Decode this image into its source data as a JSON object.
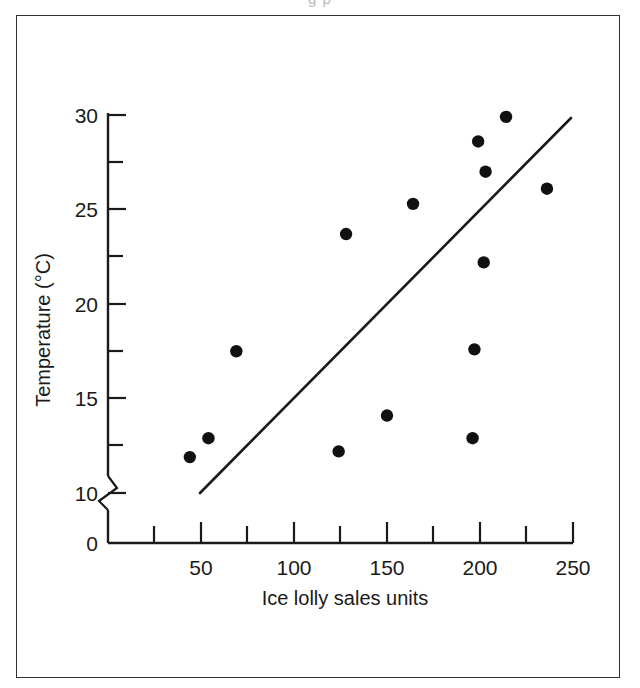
{
  "figure": {
    "scan_artifact_text": "g p"
  },
  "chart_data": {
    "type": "scatter",
    "title": "",
    "xlabel": "Ice lolly sales units",
    "ylabel": "Temperature (°C)",
    "xlim": [
      0,
      250
    ],
    "ylim": [
      10,
      30
    ],
    "y_axis_break": true,
    "y_axis_break_between": [
      0,
      10
    ],
    "grid": false,
    "legend": null,
    "x_ticks_major": [
      50,
      100,
      150,
      200,
      250
    ],
    "x_tick_labels": [
      "50",
      "100",
      "150",
      "200",
      "250"
    ],
    "x_ticks_minor": [
      25,
      75,
      125,
      175,
      225
    ],
    "y_ticks_major": [
      0,
      10,
      15,
      20,
      25,
      30
    ],
    "y_tick_labels": [
      "0",
      "10",
      "15",
      "20",
      "25",
      "30"
    ],
    "y_ticks_minor": [
      12.5,
      17.5,
      22.5,
      27.5
    ],
    "x": [
      44,
      54,
      69,
      124,
      128,
      150,
      164,
      196,
      197,
      199,
      202,
      203,
      214,
      236
    ],
    "y": [
      11.9,
      12.9,
      17.5,
      12.2,
      23.7,
      14.1,
      25.3,
      12.9,
      17.6,
      28.6,
      22.2,
      27.0,
      29.9,
      26.1
    ],
    "points": [
      {
        "x": 44,
        "y": 11.9
      },
      {
        "x": 54,
        "y": 12.9
      },
      {
        "x": 69,
        "y": 17.5
      },
      {
        "x": 124,
        "y": 12.2
      },
      {
        "x": 128,
        "y": 23.7
      },
      {
        "x": 150,
        "y": 14.1
      },
      {
        "x": 164,
        "y": 25.3
      },
      {
        "x": 196,
        "y": 12.9
      },
      {
        "x": 197,
        "y": 17.6
      },
      {
        "x": 199,
        "y": 28.6
      },
      {
        "x": 202,
        "y": 22.2
      },
      {
        "x": 203,
        "y": 27.0
      },
      {
        "x": 214,
        "y": 29.9
      },
      {
        "x": 236,
        "y": 26.1
      }
    ],
    "trend_line": {
      "type": "line-of-best-fit",
      "x_start": 50,
      "y_start": 10.0,
      "x_end": 249,
      "y_end": 29.8
    },
    "colors": {
      "point": "#111111",
      "line": "#1a1a1a",
      "axis": "#1a1a1a",
      "frame": "#33302e",
      "background": "#ffffff"
    }
  }
}
